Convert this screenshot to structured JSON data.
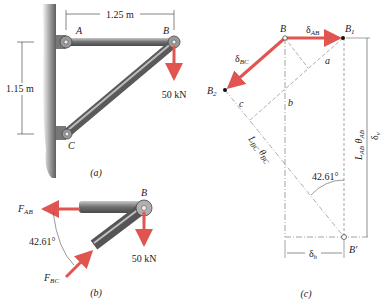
{
  "figure_a": {
    "caption": "(a)",
    "dim_horizontal": "1.25 m",
    "dim_vertical": "1.15 m",
    "point_A": "A",
    "point_B": "B",
    "point_C": "C",
    "load": "50 kN"
  },
  "figure_b": {
    "caption": "(b)",
    "point_B": "B",
    "force_AB": "F",
    "force_AB_sub": "AB",
    "force_BC": "F",
    "force_BC_sub": "BC",
    "angle": "42.61°",
    "load": "50 kN"
  },
  "figure_c": {
    "caption": "(c)",
    "point_B": "B",
    "point_B1": "B",
    "point_B1_sub": "1",
    "point_B2": "B",
    "point_B2_sub": "2",
    "point_Bprime": "B′",
    "delta_AB": "δ",
    "delta_AB_sub": "AB",
    "delta_BC": "δ",
    "delta_BC_sub": "BC",
    "label_a": "a",
    "label_b": "b",
    "label_c": "c",
    "L_BC_theta": "L",
    "L_BC_theta_sub": "BC",
    "theta_BC": "θ",
    "theta_BC_sub": "BC",
    "L_AB": "L",
    "L_AB_sub": "AB",
    "theta_AB": "θ",
    "theta_AB_sub": "AB",
    "delta_v": "δ",
    "delta_v_sub": "v",
    "delta_h": "δ",
    "delta_h_sub": "h",
    "angle": "42.61°"
  },
  "colors": {
    "force_arrow": "#e0554f",
    "member": "#8a8a8a",
    "wall": "#6f6f6f"
  }
}
